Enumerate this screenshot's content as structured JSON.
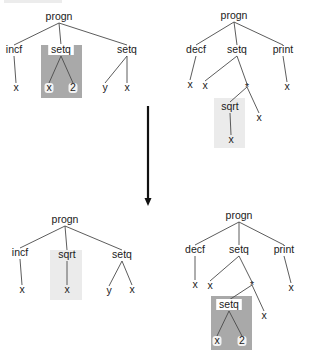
{
  "diagram": {
    "colors": {
      "edge": "#4a4a4a",
      "text": "#1a1a1a",
      "dark_highlight": "#a9a9a9",
      "light_highlight": "#ebebeb",
      "arrow": "#111111"
    },
    "arrow": {
      "x": 148,
      "y1": 106,
      "y2": 206,
      "direction": "down"
    },
    "trees": [
      {
        "id": "parent-1",
        "label": "progn",
        "highlight": {
          "type": "dark",
          "x": 41,
          "y": 45,
          "w": 41,
          "h": 53
        },
        "nodes": [
          {
            "id": "n0",
            "label": "progn",
            "x": 59,
            "y": 20
          },
          {
            "id": "n1",
            "label": "incf",
            "x": 14,
            "y": 53
          },
          {
            "id": "n2",
            "label": "setq",
            "x": 61,
            "y": 53,
            "boxed": true
          },
          {
            "id": "n3",
            "label": "setq",
            "x": 127,
            "y": 53
          },
          {
            "id": "n4",
            "label": "x",
            "x": 16,
            "y": 91
          },
          {
            "id": "n5",
            "label": "x",
            "x": 49,
            "y": 91,
            "halo": true
          },
          {
            "id": "n6",
            "label": "2",
            "x": 73,
            "y": 91,
            "halo": true
          },
          {
            "id": "n7",
            "label": "y",
            "x": 105,
            "y": 91
          },
          {
            "id": "n8",
            "label": "x",
            "x": 127,
            "y": 91
          }
        ],
        "edges": [
          [
            "n0",
            "n1"
          ],
          [
            "n0",
            "n2"
          ],
          [
            "n0",
            "n3"
          ],
          [
            "n1",
            "n4"
          ],
          [
            "n2",
            "n5"
          ],
          [
            "n2",
            "n6"
          ],
          [
            "n3",
            "n7"
          ],
          [
            "n3",
            "n8"
          ]
        ]
      },
      {
        "id": "parent-2",
        "label": "progn",
        "highlight": {
          "type": "light",
          "x": 214,
          "y": 98,
          "w": 31,
          "h": 50
        },
        "nodes": [
          {
            "id": "m0",
            "label": "progn",
            "x": 234,
            "y": 19
          },
          {
            "id": "m1",
            "label": "decf",
            "x": 196,
            "y": 53
          },
          {
            "id": "m2",
            "label": "setq",
            "x": 237,
            "y": 53
          },
          {
            "id": "m3",
            "label": "print",
            "x": 283,
            "y": 53
          },
          {
            "id": "m4",
            "label": "x",
            "x": 190,
            "y": 88
          },
          {
            "id": "m5",
            "label": "x",
            "x": 205,
            "y": 89
          },
          {
            "id": "m6",
            "label": "*",
            "x": 247,
            "y": 89
          },
          {
            "id": "m7",
            "label": "x",
            "x": 287,
            "y": 90
          },
          {
            "id": "m8",
            "label": "sqrt",
            "x": 230,
            "y": 110
          },
          {
            "id": "m9",
            "label": "x",
            "x": 259,
            "y": 121
          },
          {
            "id": "m10",
            "label": "x",
            "x": 231,
            "y": 143
          }
        ],
        "edges": [
          [
            "m0",
            "m1"
          ],
          [
            "m0",
            "m2"
          ],
          [
            "m0",
            "m3"
          ],
          [
            "m1",
            "m4"
          ],
          [
            "m2",
            "m5"
          ],
          [
            "m2",
            "m6"
          ],
          [
            "m3",
            "m7"
          ],
          [
            "m6",
            "m8"
          ],
          [
            "m6",
            "m9"
          ],
          [
            "m8",
            "m10"
          ]
        ]
      },
      {
        "id": "offspring-1",
        "label": "progn",
        "highlight": {
          "type": "light",
          "x": 50,
          "y": 250,
          "w": 32,
          "h": 50
        },
        "nodes": [
          {
            "id": "a0",
            "label": "progn",
            "x": 65,
            "y": 223
          },
          {
            "id": "a1",
            "label": "incf",
            "x": 20,
            "y": 256
          },
          {
            "id": "a2",
            "label": "sqrt",
            "x": 67,
            "y": 258
          },
          {
            "id": "a3",
            "label": "setq",
            "x": 122,
            "y": 258
          },
          {
            "id": "a4",
            "label": "x",
            "x": 22,
            "y": 293
          },
          {
            "id": "a5",
            "label": "x",
            "x": 67,
            "y": 293
          },
          {
            "id": "a6",
            "label": "y",
            "x": 109,
            "y": 294
          },
          {
            "id": "a7",
            "label": "x",
            "x": 132,
            "y": 293
          }
        ],
        "edges": [
          [
            "a0",
            "a1"
          ],
          [
            "a0",
            "a2"
          ],
          [
            "a0",
            "a3"
          ],
          [
            "a1",
            "a4"
          ],
          [
            "a2",
            "a5"
          ],
          [
            "a3",
            "a6"
          ],
          [
            "a3",
            "a7"
          ]
        ]
      },
      {
        "id": "offspring-2",
        "label": "progn",
        "highlight": {
          "type": "dark",
          "x": 211,
          "y": 296,
          "w": 41,
          "h": 54
        },
        "nodes": [
          {
            "id": "b0",
            "label": "progn",
            "x": 239,
            "y": 219
          },
          {
            "id": "b1",
            "label": "decf",
            "x": 195,
            "y": 253
          },
          {
            "id": "b2",
            "label": "setq",
            "x": 239,
            "y": 253
          },
          {
            "id": "b3",
            "label": "print",
            "x": 284,
            "y": 253
          },
          {
            "id": "b4",
            "label": "x",
            "x": 195,
            "y": 288
          },
          {
            "id": "b5",
            "label": "x",
            "x": 210,
            "y": 289
          },
          {
            "id": "b6",
            "label": "*",
            "x": 252,
            "y": 287
          },
          {
            "id": "b7",
            "label": "x",
            "x": 291,
            "y": 291
          },
          {
            "id": "b8",
            "label": "setq",
            "x": 229,
            "y": 308,
            "boxed": true
          },
          {
            "id": "b9",
            "label": "x",
            "x": 264,
            "y": 319
          },
          {
            "id": "b10",
            "label": "x",
            "x": 217,
            "y": 344,
            "halo": true
          },
          {
            "id": "b11",
            "label": "2",
            "x": 242,
            "y": 344,
            "halo": true
          }
        ],
        "edges": [
          [
            "b0",
            "b1"
          ],
          [
            "b0",
            "b2"
          ],
          [
            "b0",
            "b3"
          ],
          [
            "b1",
            "b4"
          ],
          [
            "b2",
            "b5"
          ],
          [
            "b2",
            "b6"
          ],
          [
            "b3",
            "b7"
          ],
          [
            "b6",
            "b8"
          ],
          [
            "b6",
            "b9"
          ],
          [
            "b8",
            "b10"
          ],
          [
            "b8",
            "b11"
          ]
        ]
      }
    ]
  }
}
